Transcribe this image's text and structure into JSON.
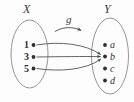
{
  "figure": {
    "kind": "function-mapping-diagram",
    "background_color": "#fdfdfd",
    "ink_color": "#4a4a4a",
    "text_color": "#2e2e2e",
    "domain": {
      "label": "X",
      "elements": [
        "1",
        "3",
        "5"
      ]
    },
    "codomain": {
      "label": "Y",
      "elements": [
        "a",
        "b",
        "c",
        "d"
      ]
    },
    "mapping": {
      "label": "g",
      "arrows": [
        {
          "from": "1",
          "to": "b"
        },
        {
          "from": "3",
          "to": "b"
        },
        {
          "from": "5",
          "to": "b"
        }
      ]
    }
  }
}
